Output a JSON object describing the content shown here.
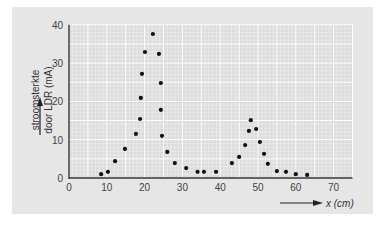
{
  "chart_data": {
    "type": "scatter",
    "title": "",
    "xlabel": "x (cm)",
    "ylabel_line1": "stroomsterkte",
    "ylabel_line2": "door LDR (mA)",
    "xlim": [
      0,
      75
    ],
    "ylim": [
      0,
      40
    ],
    "xticks": [
      0,
      10,
      20,
      30,
      40,
      50,
      60,
      70
    ],
    "yticks": [
      0,
      10,
      20,
      30,
      40
    ],
    "grid": true,
    "legend": null,
    "series": [
      {
        "name": "meetpunten",
        "points": [
          [
            8.5,
            1.0
          ],
          [
            10.3,
            1.6
          ],
          [
            12.2,
            4.4
          ],
          [
            14.8,
            7.6
          ],
          [
            17.7,
            11.5
          ],
          [
            18.8,
            15.4
          ],
          [
            19.0,
            20.9
          ],
          [
            19.3,
            27.2
          ],
          [
            20.1,
            32.9
          ],
          [
            22.2,
            37.6
          ],
          [
            23.8,
            32.4
          ],
          [
            24.3,
            24.8
          ],
          [
            24.3,
            17.8
          ],
          [
            24.6,
            11.0
          ],
          [
            26.0,
            6.8
          ],
          [
            28.0,
            3.9
          ],
          [
            31.0,
            2.6
          ],
          [
            34.0,
            1.6
          ],
          [
            35.7,
            1.6
          ],
          [
            38.9,
            1.6
          ],
          [
            43.1,
            3.9
          ],
          [
            45.0,
            5.5
          ],
          [
            46.6,
            8.6
          ],
          [
            47.6,
            12.3
          ],
          [
            48.1,
            15.1
          ],
          [
            49.5,
            12.8
          ],
          [
            50.5,
            9.4
          ],
          [
            51.6,
            6.3
          ],
          [
            52.6,
            3.7
          ],
          [
            55.0,
            1.8
          ],
          [
            57.4,
            1.6
          ],
          [
            60.0,
            1.0
          ],
          [
            63.0,
            0.8
          ]
        ]
      }
    ]
  },
  "colors": {
    "panel": "#e6e6e6",
    "plot_bg": "#dcdcdc",
    "grid_minor": "#f2f2f2",
    "grid_major": "#ffffff",
    "axis": "#333333",
    "point": "#111111"
  }
}
